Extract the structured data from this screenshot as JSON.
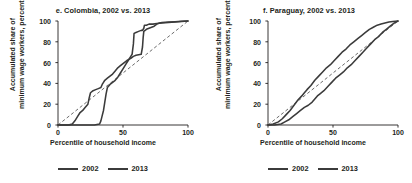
{
  "figure": {
    "background": "#ffffff",
    "line_color": "#3b3b3b",
    "reference_line_color": "#5a5a5a",
    "text_color": "#231f20"
  },
  "panels": [
    {
      "id": "colombia",
      "title": "e. Colombia, 2002 vs. 2013",
      "xlabel": "Percentile of household income",
      "ylabel_line1": "Accumulated share of",
      "ylabel_line2": "minimum wage workers, percent",
      "legend": [
        {
          "label": "2002",
          "color": "#3b3b3b"
        },
        {
          "label": "2013",
          "color": "#3b3b3b"
        }
      ]
    },
    {
      "id": "paraguay",
      "title": "f. Paraguay, 2002 vs. 2013",
      "xlabel": "Percentile of household income",
      "ylabel_line1": "Accumulated share of",
      "ylabel_line2": "minimum wage workers, percent",
      "legend": [
        {
          "label": "2002",
          "color": "#3b3b3b"
        },
        {
          "label": "2013",
          "color": "#3b3b3b"
        }
      ]
    }
  ],
  "chart_data": [
    {
      "type": "line",
      "id": "colombia",
      "title": "e. Colombia, 2002 vs. 2013",
      "xlabel": "Percentile of household income",
      "ylabel": "Accumulated share of minimum wage workers, percent",
      "xlim": [
        0,
        100
      ],
      "ylim": [
        0,
        100
      ],
      "xticks": [
        0,
        50,
        100
      ],
      "yticks": [
        0,
        20,
        40,
        60,
        80,
        100
      ],
      "xtick_labels": [
        "0",
        "50",
        "100"
      ],
      "ytick_labels": [
        "0",
        "20",
        "40",
        "60",
        "80",
        "100"
      ],
      "grid": false,
      "legend_position": "below",
      "reference_line": {
        "name": "45-degree equality line",
        "style": "dashed",
        "x": [
          0,
          100
        ],
        "y": [
          0,
          100
        ]
      },
      "series": [
        {
          "name": "2002",
          "style": "solid",
          "color": "#3b3b3b",
          "x": [
            0,
            10,
            20,
            28,
            32,
            33,
            34,
            35,
            36,
            37,
            38,
            40,
            42,
            44,
            46,
            48,
            50,
            52,
            54,
            56,
            57,
            58,
            58.5,
            60,
            62,
            64,
            65,
            66,
            66.5,
            68,
            70,
            73,
            76,
            80,
            85,
            90,
            95,
            100
          ],
          "y": [
            0,
            0,
            0,
            0,
            1,
            4,
            9,
            14,
            22,
            30,
            36,
            39,
            41,
            43,
            46,
            50,
            54,
            58,
            62,
            66,
            68,
            78,
            88,
            89,
            90,
            91,
            91,
            93,
            96,
            96,
            97,
            97,
            97.5,
            98,
            98.5,
            99,
            99.5,
            100
          ]
        },
        {
          "name": "2013",
          "style": "solid",
          "color": "#3b3b3b",
          "x": [
            0,
            8,
            11,
            13,
            15,
            17,
            19,
            21,
            23,
            24,
            25,
            27,
            29,
            31,
            33,
            34,
            35,
            36,
            38,
            40,
            42,
            44,
            46,
            48,
            50,
            53,
            56,
            58,
            60,
            62,
            64,
            65,
            65.5,
            66,
            68,
            70,
            72,
            74,
            76,
            78,
            80,
            85,
            90,
            95,
            100
          ],
          "y": [
            0,
            0,
            1,
            4,
            8,
            12,
            14,
            17,
            20,
            26,
            31,
            33,
            34,
            35,
            36,
            39,
            41,
            43,
            45,
            47,
            49,
            52,
            55,
            57,
            59,
            62,
            64,
            66,
            67,
            67.5,
            68,
            75,
            84,
            90,
            92,
            93,
            94,
            95,
            97,
            98,
            98.5,
            99,
            99.3,
            99.7,
            100
          ]
        }
      ]
    },
    {
      "type": "line",
      "id": "paraguay",
      "title": "f. Paraguay, 2002 vs. 2013",
      "xlabel": "Percentile of household income",
      "ylabel": "Accumulated share of minimum wage workers, percent",
      "xlim": [
        0,
        100
      ],
      "ylim": [
        0,
        100
      ],
      "xticks": [
        0,
        50,
        100
      ],
      "yticks": [
        0,
        20,
        40,
        60,
        80,
        100
      ],
      "xtick_labels": [
        "0",
        "50",
        "100"
      ],
      "ytick_labels": [
        "0",
        "20",
        "40",
        "60",
        "80",
        "100"
      ],
      "grid": false,
      "legend_position": "below",
      "reference_line": {
        "name": "45-degree equality line",
        "style": "dashed",
        "x": [
          0,
          100
        ],
        "y": [
          0,
          100
        ]
      },
      "series": [
        {
          "name": "2002",
          "style": "solid",
          "color": "#3b3b3b",
          "x": [
            0,
            5,
            10,
            13,
            16,
            19,
            22,
            25,
            28,
            31,
            34,
            36,
            38,
            40,
            43,
            46,
            49,
            52,
            55,
            58,
            61,
            64,
            67,
            70,
            73,
            76,
            79,
            82,
            85,
            88,
            91,
            94,
            97,
            100
          ],
          "y": [
            0,
            0,
            1,
            3,
            5,
            8,
            11,
            14,
            17,
            19,
            22,
            25,
            28,
            30,
            33,
            37,
            41,
            45,
            48,
            51,
            55,
            58,
            62,
            66,
            70,
            74,
            78,
            82,
            85,
            89,
            92,
            95,
            98,
            100
          ]
        },
        {
          "name": "2013",
          "style": "solid",
          "color": "#3b3b3b",
          "x": [
            0,
            4,
            8,
            11,
            14,
            17,
            20,
            23,
            26,
            28,
            30,
            33,
            36,
            39,
            42,
            45,
            48,
            51,
            54,
            57,
            60,
            63,
            66,
            69,
            72,
            75,
            78,
            81,
            84,
            87,
            90,
            93,
            96,
            100
          ],
          "y": [
            0,
            1,
            3,
            6,
            10,
            14,
            19,
            24,
            28,
            31,
            34,
            38,
            43,
            47,
            51,
            55,
            58,
            62,
            66,
            70,
            73,
            77,
            80,
            83,
            86,
            89,
            92,
            94,
            96,
            97,
            98,
            99,
            99.5,
            100
          ]
        }
      ]
    }
  ]
}
